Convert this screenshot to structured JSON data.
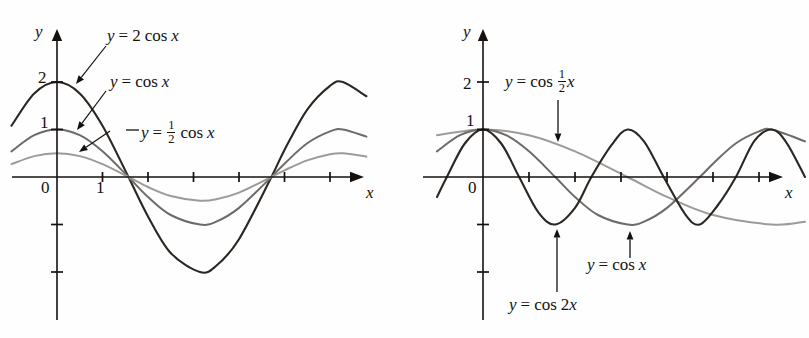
{
  "figure": {
    "background": "#fefefe",
    "ink": "#15110f",
    "panels": [
      {
        "id": "left",
        "axes": {
          "x_label": "x",
          "y_label": "y",
          "origin_label": "0",
          "y_ticks": [
            {
              "value": 2,
              "label": "2"
            },
            {
              "value": 1,
              "label": "1"
            },
            {
              "value": -1,
              "label": ""
            },
            {
              "value": -2,
              "label": ""
            }
          ],
          "x_ticks": [
            {
              "value": 1,
              "label": "1"
            },
            {
              "value": 2,
              "label": ""
            },
            {
              "value": 3,
              "label": ""
            },
            {
              "value": 4,
              "label": ""
            },
            {
              "value": 5,
              "label": ""
            },
            {
              "value": 6,
              "label": ""
            }
          ],
          "xlim": [
            -1.0,
            7.0
          ],
          "ylim": [
            -2.4,
            2.6
          ]
        },
        "labels": [
          {
            "name": "label-2cosx",
            "parts": [
              "y",
              " = 2 cos ",
              "x"
            ],
            "text": "y = 2 cos x"
          },
          {
            "name": "label-cosx",
            "parts": [
              "y",
              " = cos ",
              "x"
            ],
            "text": "y = cos x"
          },
          {
            "name": "label-half-cosx",
            "parts": [
              "y",
              " = ",
              "1/2",
              " cos ",
              "x"
            ],
            "text": "y = 1/2 cos x"
          }
        ]
      },
      {
        "id": "right",
        "axes": {
          "x_label": "x",
          "y_label": "y",
          "origin_label": "0",
          "y_ticks": [
            {
              "value": 2,
              "label": "2"
            },
            {
              "value": 1,
              "label": "1"
            },
            {
              "value": -1,
              "label": ""
            },
            {
              "value": -2,
              "label": ""
            }
          ],
          "x_ticks": [
            {
              "value": 1,
              "label": ""
            },
            {
              "value": 2,
              "label": ""
            },
            {
              "value": 3,
              "label": ""
            },
            {
              "value": 4,
              "label": ""
            },
            {
              "value": 5,
              "label": ""
            },
            {
              "value": 6,
              "label": ""
            }
          ],
          "xlim": [
            -1.0,
            7.0
          ],
          "ylim": [
            -2.4,
            2.6
          ]
        },
        "labels": [
          {
            "name": "label-cos-half-x",
            "parts": [
              "y",
              " = cos ",
              "1/2",
              "x"
            ],
            "text": "y = cos 1/2 x"
          },
          {
            "name": "label-cosx",
            "parts": [
              "y",
              " = cos ",
              "x"
            ],
            "text": "y = cos x"
          },
          {
            "name": "label-cos2x",
            "parts": [
              "y",
              " = cos 2",
              "x"
            ],
            "text": "y = cos 2x"
          }
        ]
      }
    ]
  },
  "chart_data": [
    {
      "type": "line",
      "panel": "left",
      "title": "",
      "xlabel": "x",
      "ylabel": "y",
      "xlim": [
        -1.0,
        7.0
      ],
      "ylim": [
        -2.4,
        2.6
      ],
      "xticks": [
        1,
        2,
        3,
        4,
        5,
        6
      ],
      "xticklabels": [
        "1",
        "",
        "",
        "",
        "",
        ""
      ],
      "yticks": [
        2,
        1,
        -1,
        -2
      ],
      "yticklabels": [
        "2",
        "1",
        "",
        ""
      ],
      "grid": false,
      "legend": "annotations-with-arrows",
      "series": [
        {
          "name": "y = 2 cos x",
          "expression": "2*cos(x)",
          "amplitude": 2,
          "period": 6.2832,
          "color": "#2b2622",
          "width": 2.1,
          "x": [
            -1.0,
            -0.5,
            0,
            0.5,
            1.0,
            1.5708,
            2.0,
            2.5,
            3.1416,
            3.5,
            4.0,
            4.7124,
            5.0,
            5.5,
            6.0,
            6.2832,
            6.8
          ],
          "y": [
            1.08,
            1.76,
            2.0,
            1.76,
            1.08,
            0.0,
            -0.83,
            -1.6,
            -2.0,
            -1.87,
            -1.31,
            0.0,
            0.57,
            1.42,
            1.92,
            2.0,
            1.7
          ]
        },
        {
          "name": "y = cos x",
          "expression": "cos(x)",
          "amplitude": 1,
          "period": 6.2832,
          "color": "#6d6a68",
          "width": 2.0,
          "x": [
            -1.0,
            -0.5,
            0,
            0.5,
            1.0,
            1.5708,
            2.0,
            2.5,
            3.1416,
            3.5,
            4.0,
            4.7124,
            5.0,
            5.5,
            6.0,
            6.2832,
            6.8
          ],
          "y": [
            0.54,
            0.88,
            1.0,
            0.88,
            0.54,
            0.0,
            -0.42,
            -0.8,
            -1.0,
            -0.94,
            -0.65,
            0.0,
            0.28,
            0.71,
            0.96,
            1.0,
            0.85
          ]
        },
        {
          "name": "y = 1/2 cos x",
          "expression": "0.5*cos(x)",
          "amplitude": 0.5,
          "period": 6.2832,
          "color": "#9d9b99",
          "width": 2.0,
          "x": [
            -1.0,
            -0.5,
            0,
            0.5,
            1.0,
            1.5708,
            2.0,
            2.5,
            3.1416,
            3.5,
            4.0,
            4.7124,
            5.0,
            5.5,
            6.0,
            6.2832,
            6.8
          ],
          "y": [
            0.27,
            0.44,
            0.5,
            0.44,
            0.27,
            0.0,
            -0.21,
            -0.4,
            -0.5,
            -0.47,
            -0.33,
            0.0,
            0.14,
            0.35,
            0.48,
            0.5,
            0.43
          ]
        }
      ],
      "annotations": [
        {
          "text": "y = 2 cos x",
          "points_to_series": "y = 2 cos x"
        },
        {
          "text": "y = cos x",
          "points_to_series": "y = cos x"
        },
        {
          "text": "y = 1/2 cos x",
          "points_to_series": "y = 1/2 cos x"
        }
      ]
    },
    {
      "type": "line",
      "panel": "right",
      "title": "",
      "xlabel": "x",
      "ylabel": "y",
      "xlim": [
        -1.0,
        7.0
      ],
      "ylim": [
        -2.4,
        2.6
      ],
      "xticks": [
        1,
        2,
        3,
        4,
        5,
        6
      ],
      "xticklabels": [
        "",
        "",
        "",
        "",
        "",
        ""
      ],
      "yticks": [
        2,
        1,
        -1,
        -2
      ],
      "yticklabels": [
        "2",
        "1",
        "",
        ""
      ],
      "grid": false,
      "legend": "annotations-with-arrows",
      "series": [
        {
          "name": "y = cos 1/2 x",
          "expression": "cos(0.5*x)",
          "amplitude": 1,
          "period": 12.566,
          "color": "#9d9b99",
          "width": 2.0,
          "x": [
            -1.0,
            0,
            1.0,
            2.0,
            3.1416,
            4.0,
            5.0,
            6.2832,
            7.0
          ],
          "y": [
            0.88,
            1.0,
            0.88,
            0.54,
            0.0,
            -0.42,
            -0.8,
            -1.0,
            -0.94
          ]
        },
        {
          "name": "y = cos x",
          "expression": "cos(x)",
          "amplitude": 1,
          "period": 6.2832,
          "color": "#6d6a68",
          "width": 2.0,
          "x": [
            -1.0,
            -0.5,
            0,
            0.5,
            1.0,
            1.5708,
            2.0,
            2.5,
            3.1416,
            3.5,
            4.0,
            4.7124,
            5.0,
            5.5,
            6.0,
            6.2832,
            7.0
          ],
          "y": [
            0.54,
            0.88,
            1.0,
            0.88,
            0.54,
            0.0,
            -0.42,
            -0.8,
            -1.0,
            -0.94,
            -0.65,
            0.0,
            0.28,
            0.71,
            0.96,
            1.0,
            0.75
          ]
        },
        {
          "name": "y = cos 2x",
          "expression": "cos(2*x)",
          "amplitude": 1,
          "period": 3.1416,
          "color": "#2b2622",
          "width": 2.1,
          "x": [
            -1.0,
            -0.7854,
            -0.4,
            0,
            0.4,
            0.7854,
            1.2,
            1.5708,
            2.0,
            2.3562,
            2.8,
            3.1416,
            3.5,
            3.927,
            4.4,
            4.7124,
            5.1,
            5.4978,
            5.9,
            6.2832,
            6.6,
            7.0
          ],
          "y": [
            -0.42,
            0.0,
            0.7,
            1.0,
            0.7,
            0.0,
            -0.74,
            -1.0,
            -0.65,
            0.0,
            0.68,
            1.0,
            0.75,
            0.0,
            -0.79,
            -1.0,
            -0.6,
            0.0,
            0.76,
            1.0,
            0.72,
            0.0
          ]
        }
      ],
      "annotations": [
        {
          "text": "y = cos 1/2 x",
          "points_to_series": "y = cos 1/2 x"
        },
        {
          "text": "y = cos x",
          "points_to_series": "y = cos x"
        },
        {
          "text": "y = cos 2x",
          "points_to_series": "y = cos 2x"
        }
      ]
    }
  ]
}
